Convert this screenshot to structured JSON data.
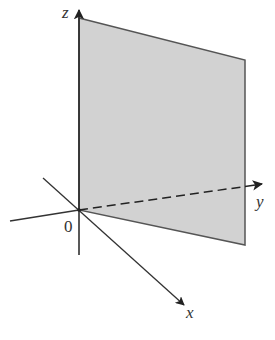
{
  "diagram": {
    "labels": {
      "z": "z",
      "y": "y",
      "x": "x",
      "origin": "0"
    },
    "colors": {
      "plane_fill": "#d2d2d2",
      "plane_edge": "#555555",
      "axis": "#333333",
      "background": "#ffffff"
    },
    "plane": {
      "points": "79,18 245,60 245,245 79,210"
    },
    "axes": {
      "origin": [
        79,
        210
      ],
      "z_axis": {
        "from": [
          79,
          255
        ],
        "to": [
          79,
          8
        ]
      },
      "y_axis_solid": {
        "from": [
          10,
          221
        ],
        "to": [
          79,
          210
        ]
      },
      "y_axis_dashed": {
        "from": [
          79,
          210
        ],
        "to": [
          262,
          184
        ]
      },
      "x_axis": {
        "from": [
          43,
          178
        ],
        "to": [
          184,
          305
        ]
      }
    }
  }
}
